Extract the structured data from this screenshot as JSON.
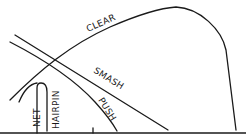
{
  "diagram": {
    "type": "shot-trajectories",
    "ink_color": "#1a1a1a",
    "background": "#ffffff",
    "shots": [
      {
        "name": "clear",
        "label": "CLEAR"
      },
      {
        "name": "smash",
        "label": "SMASH"
      },
      {
        "name": "push",
        "label": "PUSH"
      },
      {
        "name": "net",
        "label": "NET"
      },
      {
        "name": "hairpin",
        "label": "HAIRPIN"
      }
    ],
    "ground": {
      "ticks": 2
    }
  }
}
